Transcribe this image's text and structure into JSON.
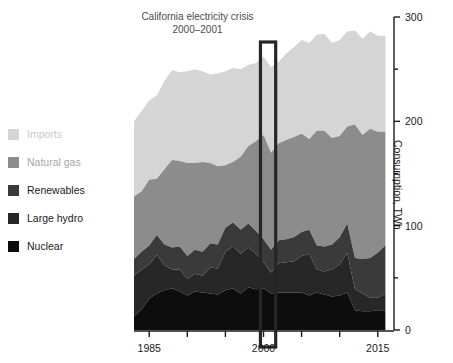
{
  "figure": {
    "background": "#ffffff",
    "width": 453,
    "height": 363
  },
  "annotation": {
    "line1": "California electricity crisis",
    "line2": "2000–2001",
    "highlight_start_year": 1999.6,
    "highlight_end_year": 2001.6,
    "highlight_color": "#262626"
  },
  "legend": {
    "items": [
      {
        "label": "Imports",
        "color": "#d5d5d5",
        "text_color": "#c9c9c9"
      },
      {
        "label": "Natural gas",
        "color": "#8c8c8c",
        "text_color": "#a8a8a8"
      },
      {
        "label": "Renewables",
        "color": "#3a3a3a",
        "text_color": "#1a1a1a"
      },
      {
        "label": "Large hydro",
        "color": "#272727",
        "text_color": "#1a1a1a"
      },
      {
        "label": "Nuclear",
        "color": "#0d0d0d",
        "text_color": "#1a1a1a"
      }
    ]
  },
  "axes": {
    "y_label": "Consumption, TWh",
    "y_major_ticks": [
      0,
      100,
      200,
      300
    ],
    "y_minor_ticks": [
      50,
      150,
      250
    ],
    "y_tick_labels": [
      "0",
      "100",
      "200",
      "300"
    ],
    "x_major_ticks": [
      1985,
      2000,
      2015
    ],
    "x_tick_labels": [
      "1985",
      "2000",
      "2015"
    ],
    "x_all_ticks": [
      1985,
      1990,
      1995,
      2000,
      2005,
      2010,
      2015
    ]
  },
  "chart_data": {
    "type": "area",
    "stacked": true,
    "title": "",
    "xlabel": "",
    "ylabel": "Consumption, TWh",
    "xlim": [
      1983,
      2017
    ],
    "ylim": [
      0,
      300
    ],
    "grid": false,
    "legend_position": "left-outside",
    "x": [
      1983,
      1984,
      1985,
      1986,
      1987,
      1988,
      1989,
      1990,
      1991,
      1992,
      1993,
      1994,
      1995,
      1996,
      1997,
      1998,
      1999,
      2000,
      2001,
      2002,
      2003,
      2004,
      2005,
      2006,
      2007,
      2008,
      2009,
      2010,
      2011,
      2012,
      2013,
      2014,
      2015,
      2016
    ],
    "series": [
      {
        "name": "Nuclear",
        "color": "#0d0d0d",
        "values": [
          13,
          20,
          30,
          35,
          38,
          40,
          37,
          33,
          37,
          36,
          35,
          34,
          38,
          40,
          35,
          41,
          39,
          40,
          35,
          36,
          36,
          36,
          36,
          33,
          36,
          34,
          32,
          33,
          36,
          19,
          18,
          18,
          19,
          19
        ]
      },
      {
        "name": "Large hydro",
        "color": "#272727",
        "values": [
          39,
          38,
          33,
          37,
          24,
          18,
          21,
          16,
          17,
          16,
          25,
          25,
          37,
          40,
          38,
          38,
          34,
          25,
          20,
          28,
          29,
          30,
          35,
          40,
          22,
          22,
          26,
          30,
          38,
          20,
          17,
          13,
          12,
          16
        ]
      },
      {
        "name": "Renewables",
        "color": "#3a3a3a",
        "values": [
          16,
          17,
          18,
          19,
          20,
          21,
          22,
          22,
          23,
          23,
          23,
          23,
          23,
          23,
          23,
          23,
          22,
          22,
          22,
          22,
          22,
          23,
          23,
          23,
          23,
          24,
          24,
          26,
          28,
          30,
          33,
          38,
          43,
          46
        ]
      },
      {
        "name": "Natural gas",
        "color": "#8c8c8c",
        "values": [
          60,
          58,
          63,
          54,
          72,
          84,
          82,
          89,
          83,
          86,
          77,
          75,
          60,
          58,
          70,
          74,
          86,
          100,
          93,
          93,
          95,
          96,
          94,
          87,
          110,
          111,
          102,
          97,
          93,
          128,
          119,
          124,
          116,
          109
        ]
      },
      {
        "name": "Imports",
        "color": "#d5d5d5",
        "values": [
          72,
          77,
          76,
          80,
          85,
          86,
          85,
          88,
          90,
          87,
          85,
          89,
          90,
          90,
          84,
          78,
          75,
          75,
          82,
          78,
          83,
          86,
          90,
          92,
          92,
          93,
          91,
          92,
          91,
          90,
          92,
          93,
          92,
          92
        ]
      }
    ]
  }
}
